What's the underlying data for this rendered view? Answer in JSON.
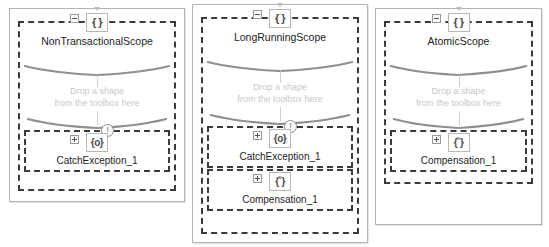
{
  "canvas": {
    "drop_hint_line1": "Drop a shape",
    "drop_hint_line2": "from the toolbox here",
    "collapse_glyph": "−",
    "expand_glyph": "+",
    "warning_glyph": "!",
    "scope_icon_glyph": "{ }",
    "catch_icon_glyph": "{o}",
    "compensation_icon_glyph": "{˚}",
    "colors": {
      "panel_border": "#b4b4b4",
      "activity_border": "#3a3a3a",
      "title_text": "#1d1d1d",
      "hint_text": "#c8c8c8",
      "brace_stroke": "#8f8f8f",
      "background": "#ffffff"
    }
  },
  "panels": [
    {
      "scope": {
        "title": "NonTransactionalScope",
        "icon": "{ }",
        "drop_hint_line1": "Drop a shape",
        "drop_hint_line2": "from the toolbox here"
      },
      "children": [
        {
          "title": "CatchException_1",
          "icon": "{o}",
          "has_warning": true
        }
      ]
    },
    {
      "scope": {
        "title": "LongRunningScope",
        "icon": "{ }",
        "drop_hint_line1": "Drop a shape",
        "drop_hint_line2": "from the toolbox here"
      },
      "children": [
        {
          "title": "CatchException_1",
          "icon": "{o}",
          "has_warning": true
        },
        {
          "title": "Compensation_1",
          "icon": "{˚}",
          "has_warning": false
        }
      ]
    },
    {
      "scope": {
        "title": "AtomicScope",
        "icon": "{ }",
        "drop_hint_line1": "Drop a shape",
        "drop_hint_line2": "from the toolbox here"
      },
      "children": [
        {
          "title": "Compensation_1",
          "icon": "{˚}",
          "has_warning": false
        }
      ]
    }
  ]
}
